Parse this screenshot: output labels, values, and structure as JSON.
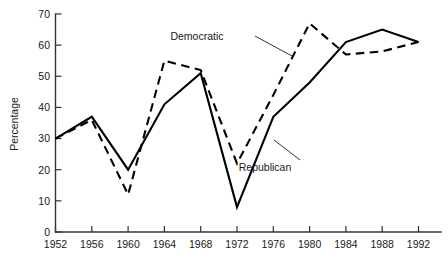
{
  "chart_data": {
    "type": "line",
    "title": "",
    "subtitle": "",
    "xlabel": "",
    "ylabel": "Percentage",
    "x": [
      1952,
      1956,
      1960,
      1964,
      1968,
      1972,
      1976,
      1980,
      1984,
      1988,
      1992
    ],
    "categories": [
      "1952",
      "1956",
      "1960",
      "1964",
      "1968",
      "1972",
      "1976",
      "1980",
      "1984",
      "1988",
      "1992"
    ],
    "xlim": [
      1952,
      1992
    ],
    "ylim": [
      0,
      70
    ],
    "y_ticks": [
      0,
      10,
      20,
      30,
      40,
      50,
      60,
      70
    ],
    "y_tick_labels": [
      "0",
      "10",
      "20",
      "30",
      "40",
      "50",
      "60",
      "70"
    ],
    "x_ticks": [
      1952,
      1956,
      1960,
      1964,
      1968,
      1972,
      1976,
      1980,
      1984,
      1988,
      1992
    ],
    "x_tick_labels": [
      "1952",
      "1956",
      "1960",
      "1964",
      "1968",
      "1972",
      "1976",
      "1980",
      "1984",
      "1988",
      "1992"
    ],
    "grid": false,
    "legend_position": "inline-annotation",
    "series": [
      {
        "name": "Republican",
        "style": "solid",
        "color": "#000000",
        "values": [
          30,
          37,
          20,
          41,
          51,
          8,
          37,
          48,
          61,
          65,
          61
        ]
      },
      {
        "name": "Democratic",
        "style": "dashed",
        "color": "#000000",
        "values": [
          30,
          36,
          12,
          55,
          52,
          22,
          44,
          67,
          57,
          58,
          61
        ]
      }
    ],
    "annotations": [
      {
        "text": "Democratic",
        "x_px": 197,
        "y_px": 40,
        "leader_from_x": 255,
        "leader_from_y": 36,
        "leader_to_x": 292,
        "leader_to_y": 56
      },
      {
        "text": "Republican",
        "x_px": 265,
        "y_px": 171,
        "leader_from_x": 300,
        "leader_from_y": 160,
        "leader_to_x": 274,
        "leader_to_y": 140
      }
    ]
  }
}
